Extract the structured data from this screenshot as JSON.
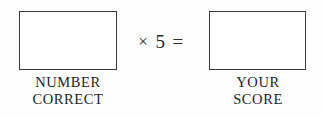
{
  "form": {
    "title": "Test scoring worksheet",
    "background_color": "#fdfdfd",
    "ink_color": "#1f1f1f",
    "border_color": "#3a3a3a"
  },
  "number_correct": {
    "value": "",
    "placeholder": "",
    "caption_line1": "NUMBER",
    "caption_line2": "CORRECT"
  },
  "formula": {
    "operator_multiply": "×",
    "multiplier": "5",
    "operator_equals": "="
  },
  "your_score": {
    "value": "",
    "placeholder": "",
    "caption_line1": "YOUR",
    "caption_line2": "SCORE"
  }
}
